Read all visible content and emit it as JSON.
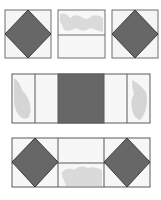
{
  "figure": {
    "colors": {
      "dark": "#676767",
      "outline": "#5a5a5a",
      "background": "#f7f7f7",
      "print": "#d2d2d2"
    },
    "rows": [
      {
        "name": "top-row",
        "blocks": [
          "square-in-square",
          "two-strip-print",
          "square-in-square"
        ]
      },
      {
        "name": "middle-row",
        "blocks": [
          "print-strip",
          "plain-strip",
          "dark-center-square",
          "plain-strip",
          "print-strip"
        ]
      },
      {
        "name": "bottom-row",
        "blocks": [
          "square-in-square",
          "split-print",
          "square-in-square"
        ]
      }
    ]
  }
}
